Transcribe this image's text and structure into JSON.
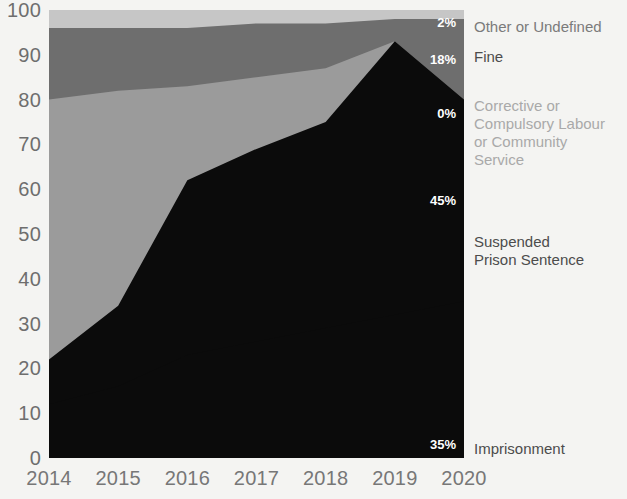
{
  "chart_data": {
    "type": "area",
    "stacked": true,
    "title": "",
    "xlabel": "",
    "ylabel": "",
    "x": [
      2014,
      2015,
      2016,
      2017,
      2018,
      2019,
      2020
    ],
    "xtick_labels": [
      "2014",
      "2015",
      "2016",
      "2017",
      "2018",
      "2019",
      "2020"
    ],
    "ytick_labels": [
      "0",
      "10",
      "20",
      "30",
      "40",
      "50",
      "60",
      "70",
      "80",
      "90",
      "100"
    ],
    "ylim": [
      0,
      100
    ],
    "xlim": [
      2014,
      2020
    ],
    "grid": false,
    "legend_position": "right",
    "series": [
      {
        "name": "Imprisonment",
        "color": "#0b0b0b",
        "end_label": "35%",
        "values": [
          12,
          16,
          23,
          26,
          29,
          32,
          35
        ]
      },
      {
        "name": "Suspended Prison Sentence",
        "color": "#0b0b0b",
        "end_label": "45%",
        "values": [
          10,
          18,
          39,
          43,
          46,
          61,
          45
        ]
      },
      {
        "name": "Corrective or Compulsory Labour or Community Service",
        "color": "#9b9b9b",
        "end_label": "0%",
        "values": [
          58,
          48,
          21,
          16,
          12,
          0,
          0
        ]
      },
      {
        "name": "Fine",
        "color": "#6e6e6e",
        "end_label": "18%",
        "values": [
          16,
          14,
          13,
          12,
          10,
          5,
          18
        ]
      },
      {
        "name": "Other or Undefined",
        "color": "#c6c6c6",
        "end_label": "2%",
        "values": [
          4,
          4,
          4,
          3,
          3,
          2,
          2
        ]
      }
    ]
  },
  "legend": [
    {
      "label": "Other or Undefined",
      "value": "2%",
      "tone": "mid"
    },
    {
      "label": "Fine",
      "value": "18%",
      "tone": "dark"
    },
    {
      "label": "Corrective or\nCompulsory Labour\nor Community\nService",
      "value": "0%",
      "tone": "light"
    },
    {
      "label": "Suspended\nPrison Sentence",
      "value": "45%",
      "tone": "dark"
    },
    {
      "label": "Imprisonment",
      "value": "35%",
      "tone": "dark"
    }
  ],
  "colors": {
    "background": "#f4f4f2",
    "imprisonment": "#0b0b0b",
    "suspended": "#0b0b0b",
    "corrective": "#9b9b9b",
    "fine": "#6e6e6e",
    "other": "#c6c6c6",
    "axis_text": "#6e6e6e",
    "value_text": "#ffffff"
  }
}
